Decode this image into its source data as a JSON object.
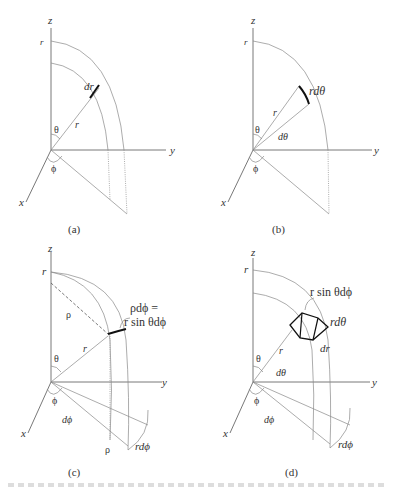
{
  "figure": {
    "panels": [
      {
        "id": "a",
        "caption": "(a)",
        "labels": {
          "z": "z",
          "y": "y",
          "x": "x",
          "r_top": "r",
          "r": "r",
          "theta": "θ",
          "phi": "ϕ",
          "element": "dr"
        }
      },
      {
        "id": "b",
        "caption": "(b)",
        "labels": {
          "z": "z",
          "y": "y",
          "x": "x",
          "r_top": "r",
          "r": "r",
          "theta": "θ",
          "phi": "ϕ",
          "element": "rdθ",
          "dtheta": "dθ"
        }
      },
      {
        "id": "c",
        "caption": "(c)",
        "labels": {
          "z": "z",
          "y": "y",
          "x": "x",
          "r_top": "r",
          "r": "r",
          "theta": "θ",
          "phi": "ϕ",
          "rho": "ρ",
          "rho_bottom": "ρ",
          "dphi": "dϕ",
          "rdphi": "rdϕ",
          "element_line1": "ρdϕ =",
          "element_line2": "r sin θdϕ"
        }
      },
      {
        "id": "d",
        "caption": "(d)",
        "labels": {
          "z": "z",
          "y": "y",
          "x": "x",
          "r_top": "r",
          "r": "r",
          "theta": "θ",
          "phi": "ϕ",
          "dtheta": "dθ",
          "dphi": "dϕ",
          "rdphi": "rdϕ",
          "rdtheta": "rdθ",
          "dr": "dr",
          "element": "r sin θdϕ"
        }
      }
    ]
  }
}
